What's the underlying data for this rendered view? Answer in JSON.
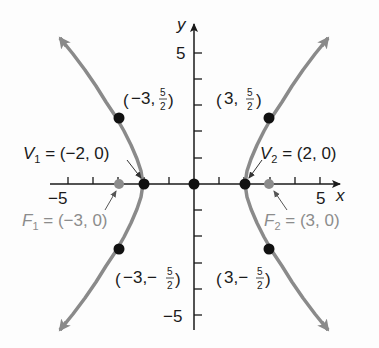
{
  "figure": {
    "equation_implied": "x^2/4 - y^2/5 = 1",
    "colors": {
      "axes": "#1a1a1a",
      "curve": "#8a8a8a",
      "point": "#111111",
      "focus_point": "#8c8c8c",
      "focus_label": "#8c8c8c"
    },
    "axes": {
      "x_label": "x",
      "y_label": "y",
      "x_tick_labels": [
        {
          "value": -5,
          "text": "−5"
        },
        {
          "value": 5,
          "text": "5"
        }
      ],
      "y_tick_labels": [
        {
          "value": 5,
          "text": "5"
        },
        {
          "value": -5,
          "text": "−5"
        }
      ],
      "x_ticks": [
        -5,
        -4,
        -3,
        -2,
        -1,
        1,
        2,
        3,
        4,
        5
      ],
      "y_ticks": [
        -5,
        -4,
        -3,
        -2,
        -1,
        1,
        2,
        3,
        4,
        5
      ]
    },
    "labels": {
      "v1": {
        "letter": "V",
        "sub": "1",
        "rest": " = (−2, 0)"
      },
      "v2": {
        "letter": "V",
        "sub": "2",
        "rest": " = (2, 0)"
      },
      "f1": {
        "letter": "F",
        "sub": "1",
        "rest": " = (−3, 0)"
      },
      "f2": {
        "letter": "F",
        "sub": "2",
        "rest": " = (3, 0)"
      },
      "p_ul": {
        "open": "(",
        "coord": "−3,",
        "num": "5",
        "den": "2",
        "close": ")"
      },
      "p_ur": {
        "open": "(",
        "coord": "3,",
        "num": "5",
        "den": "2",
        "close": ")"
      },
      "p_ll": {
        "open": "(",
        "coord": "−3,−",
        "num": "5",
        "den": "2",
        "close": ")"
      },
      "p_lr": {
        "open": "(",
        "coord": "3,−",
        "num": "5",
        "den": "2",
        "close": ")"
      }
    },
    "points": [
      {
        "name": "origin",
        "x": 0,
        "y": 0
      },
      {
        "name": "V1",
        "x": -2,
        "y": 0
      },
      {
        "name": "V2",
        "x": 2,
        "y": 0
      },
      {
        "name": "F1",
        "x": -3,
        "y": 0
      },
      {
        "name": "F2",
        "x": 3,
        "y": 0
      },
      {
        "name": "P1",
        "x": -3,
        "y": 2.5
      },
      {
        "name": "P2",
        "x": 3,
        "y": 2.5
      },
      {
        "name": "P3",
        "x": -3,
        "y": -2.5
      },
      {
        "name": "P4",
        "x": 3,
        "y": -2.5
      }
    ]
  }
}
